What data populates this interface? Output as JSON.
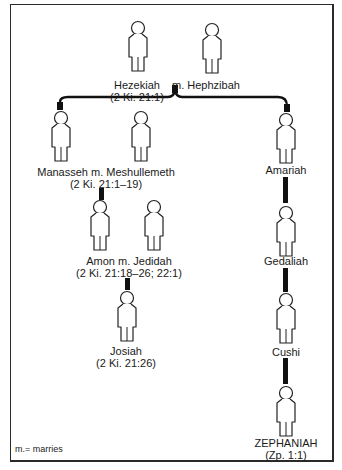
{
  "diagram": {
    "people": [
      {
        "id": "hezekiah",
        "name": "Hezekiah",
        "ref": "(2 Ki. 21:1)"
      },
      {
        "id": "hephzibah",
        "name": "m. Hephzibah"
      },
      {
        "id": "manasseh",
        "name": "Manasseh m. Meshullemeth",
        "ref": "(2 Ki. 21:1–19)"
      },
      {
        "id": "amon",
        "name": "Amon m. Jedidah",
        "ref": "(2 Ki. 21:18–26; 22:1)"
      },
      {
        "id": "josiah",
        "name": "Josiah",
        "ref": "(2 Ki. 21:26)"
      },
      {
        "id": "amariah",
        "name": "Amariah"
      },
      {
        "id": "gedaliah",
        "name": "Gedaliah"
      },
      {
        "id": "cushi",
        "name": "Cushi"
      },
      {
        "id": "zephaniah",
        "name": "ZEPHANIAH",
        "ref": "(Zp. 1:1)"
      }
    ],
    "legend": "m.= marries"
  }
}
